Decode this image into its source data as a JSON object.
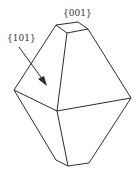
{
  "figure": {
    "type": "crystal-bipyramid",
    "labels": {
      "top_facet": "{001}",
      "side_facet": "{101}"
    },
    "line_color": "#2b2b2b"
  }
}
